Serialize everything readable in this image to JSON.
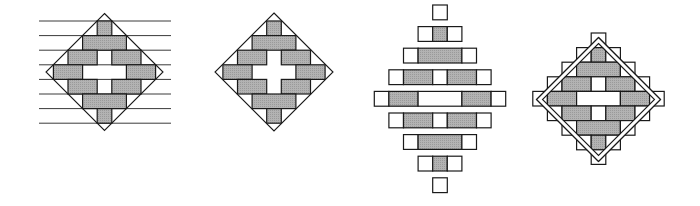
{
  "colors": {
    "background": "#ffffff",
    "stroke": "#1a1a1a",
    "fill_gray": "#a9a9a9",
    "fill_white": "#ffffff",
    "guide_line": "#3a3a3a"
  },
  "unit": 14.6,
  "figures": [
    {
      "id": "figure-1",
      "label": "diamond-with-horizontal-guides",
      "center": [
        104.5,
        72
      ],
      "diamond_half": 58.5,
      "double_diamond": false,
      "row_top": 21,
      "row_pitch": 14.6,
      "row_height": 14.6,
      "guide_lines": {
        "x1": 39,
        "x2": 171,
        "ys": [
          21,
          35.6,
          50.2,
          64.8,
          79.4,
          94,
          108.6,
          123.2
        ]
      },
      "rows": [
        [
          "G"
        ],
        [
          "G3"
        ],
        [
          "G2",
          "W",
          "G2"
        ],
        [
          "G2",
          "W3",
          "G2"
        ],
        [
          "G2",
          "W",
          "G2"
        ],
        [
          "G3"
        ],
        [
          "G"
        ]
      ],
      "show_white_cells": false
    },
    {
      "id": "figure-2",
      "label": "diamond-bricks",
      "center": [
        274,
        72
      ],
      "diamond_half": 59,
      "double_diamond": false,
      "row_top": 21,
      "row_pitch": 14.6,
      "row_height": 14.6,
      "guide_lines": null,
      "rows": [
        [
          "G"
        ],
        [
          "G3"
        ],
        [
          "G2",
          "W",
          "G2"
        ],
        [
          "G2",
          "W3",
          "G2"
        ],
        [
          "G2",
          "W",
          "G2"
        ],
        [
          "G3"
        ],
        [
          "G"
        ]
      ],
      "show_white_cells": false
    },
    {
      "id": "figure-3",
      "label": "exploded-rows",
      "center": [
        440,
        99
      ],
      "diamond_half": 0,
      "double_diamond": false,
      "row_top": 5,
      "row_pitch": 21.6,
      "row_height": 14.8,
      "guide_lines": null,
      "rows": [
        [
          "W"
        ],
        [
          "W",
          "G",
          "W"
        ],
        [
          "W",
          "G3",
          "W"
        ],
        [
          "W",
          "G2",
          "W",
          "G2",
          "W"
        ],
        [
          "W",
          "G2",
          "W3",
          "G2",
          "W"
        ],
        [
          "W",
          "G2",
          "W",
          "G2",
          "W"
        ],
        [
          "W",
          "G3",
          "W"
        ],
        [
          "W",
          "G",
          "W"
        ],
        [
          "W"
        ]
      ],
      "show_white_cells": true
    },
    {
      "id": "figure-4",
      "label": "stepped-diamond-double-outline",
      "center": [
        598.5,
        99.5
      ],
      "diamond_half": 62,
      "inner_diamond_half": 56,
      "double_diamond": true,
      "row_top": 33,
      "row_pitch": 14.6,
      "row_height": 14.6,
      "guide_lines": null,
      "rows": [
        [
          "W"
        ],
        [
          "W",
          "G",
          "W"
        ],
        [
          "W",
          "G3",
          "W"
        ],
        [
          "W",
          "G2",
          "W",
          "G2",
          "W"
        ],
        [
          "W",
          "G2",
          "W3",
          "G2",
          "W"
        ],
        [
          "W",
          "G2",
          "W",
          "G2",
          "W"
        ],
        [
          "W",
          "G3",
          "W"
        ],
        [
          "W",
          "G",
          "W"
        ],
        [
          "W"
        ]
      ],
      "show_white_cells": true
    }
  ]
}
